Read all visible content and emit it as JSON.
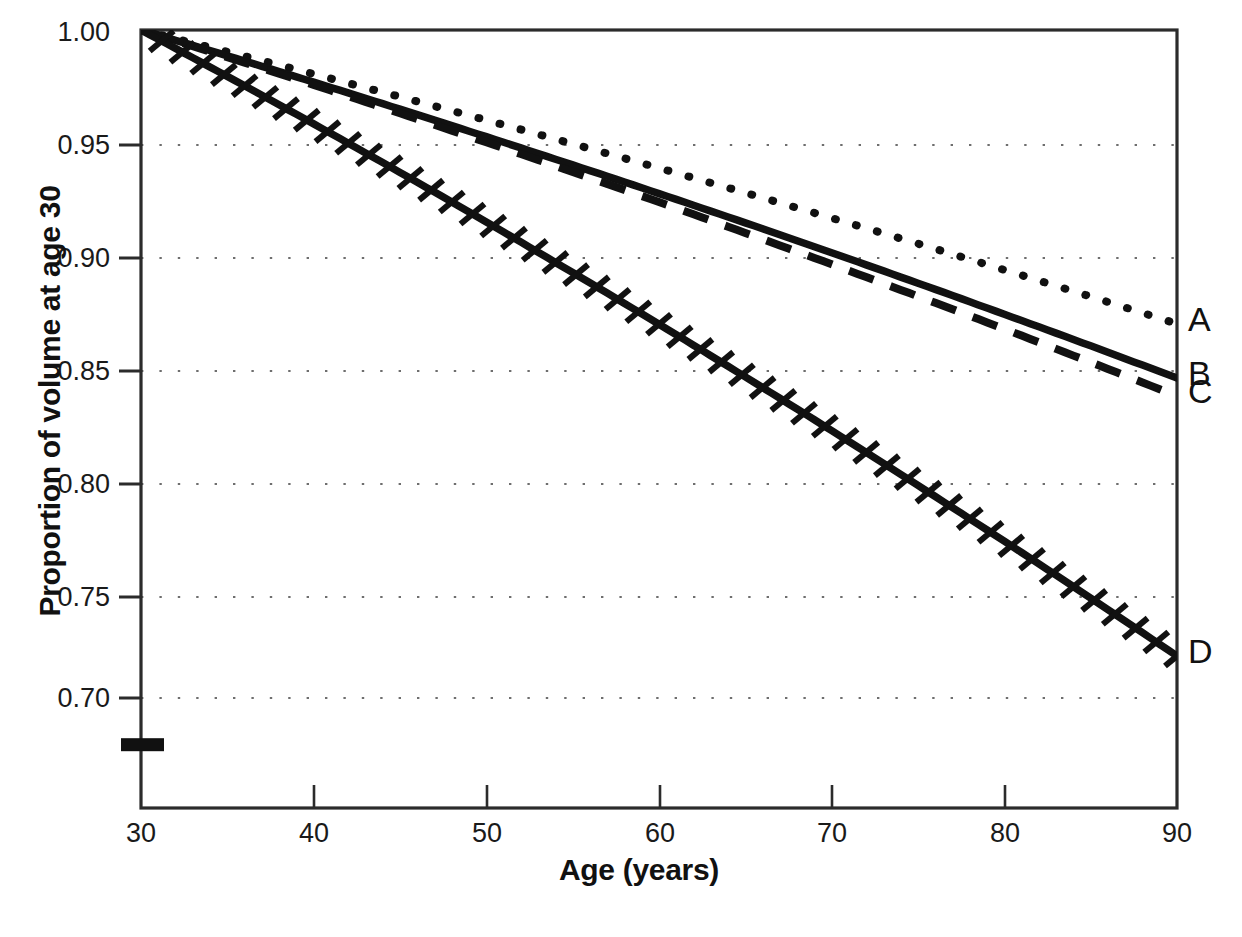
{
  "chart_data": {
    "type": "line",
    "title": "",
    "xlabel": "Age (years)",
    "ylabel": "Proportion of volume at age 30",
    "xlim": [
      30,
      90
    ],
    "ylim": [
      0.665,
      1.005
    ],
    "xticks": [
      "30",
      "40",
      "50",
      "60",
      "70",
      "80",
      "90"
    ],
    "xtick_values": [
      30,
      40,
      50,
      60,
      70,
      80,
      90
    ],
    "yticks": [
      "1.00",
      "0.95",
      "0.90",
      "0.85",
      "0.80",
      "0.75",
      "0.70"
    ],
    "ytick_values": [
      1.0,
      0.95,
      0.9,
      0.85,
      0.8,
      0.75,
      0.7
    ],
    "grid": "horizontal-dotted",
    "legend_position": "right-of-axes-inline",
    "x": [
      30,
      35,
      40,
      45,
      50,
      55,
      60,
      65,
      70,
      75,
      80,
      85,
      90
    ],
    "series": [
      {
        "name": "A",
        "label": "A",
        "style": "dotted",
        "color": "#111111",
        "values": [
          1.0,
          0.9925,
          0.985,
          0.9775,
          0.9695,
          0.9605,
          0.951,
          0.9405,
          0.929,
          0.9165,
          0.903,
          0.8865,
          0.87
        ]
      },
      {
        "name": "B",
        "label": "B",
        "style": "solid",
        "color": "#111111",
        "values": [
          1.0,
          0.9905,
          0.981,
          0.9715,
          0.9615,
          0.9505,
          0.939,
          0.9255,
          0.9105,
          0.8935,
          0.876,
          0.8605,
          0.846
        ]
      },
      {
        "name": "C",
        "label": "C",
        "style": "dashed",
        "color": "#111111",
        "values": [
          1.0,
          0.9895,
          0.979,
          0.9685,
          0.958,
          0.947,
          0.9355,
          0.9225,
          0.9075,
          0.891,
          0.873,
          0.855,
          0.838
        ]
      },
      {
        "name": "D",
        "label": "D",
        "style": "solid-hatched",
        "color": "#111111",
        "values": [
          1.0,
          0.9845,
          0.969,
          0.9535,
          0.938,
          0.9225,
          0.9065,
          0.8905,
          0.8735,
          0.856,
          0.8,
          0.768,
          0.723
        ],
        "values_note": "monotone decline from 1.00 at age 30 to about 0.723 at age 90"
      }
    ],
    "marker": {
      "name": "baseline-bar",
      "description": "solid black rectangle straddling the y-axis below the 0.70 tick",
      "x": 30,
      "y_approx": 0.684
    }
  },
  "curve_labels": {
    "a": "A",
    "b": "B",
    "c": "C",
    "d": "D"
  }
}
